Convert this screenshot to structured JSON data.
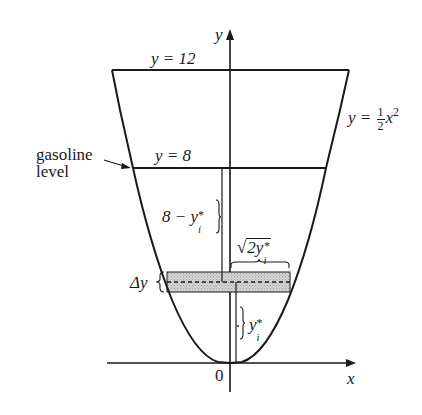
{
  "diagram": {
    "axes": {
      "x_label": "x",
      "y_label": "y",
      "origin_label": "0"
    },
    "curve": {
      "equation_lhs": "y =",
      "equation_frac_num": "1",
      "equation_frac_den": "2",
      "equation_var": "x",
      "equation_exp": "2"
    },
    "levels": {
      "top": "y = 12",
      "gasoline": "y = 8"
    },
    "annotations": {
      "gasoline_label_line1": "gasoline",
      "gasoline_label_line2": "level",
      "distance_label_prefix": "8 − y",
      "distance_label_sub": "i",
      "distance_label_sup": "*",
      "half_width_radicand": "2y",
      "half_width_sub": "i",
      "half_width_sup": "*",
      "slice_thickness": "Δy",
      "slice_height_var": "y",
      "slice_height_sub": "i",
      "slice_height_sup": "*"
    },
    "colors": {
      "ink": "#1a1a1a",
      "slice_fill": "#c8c8c8"
    }
  }
}
